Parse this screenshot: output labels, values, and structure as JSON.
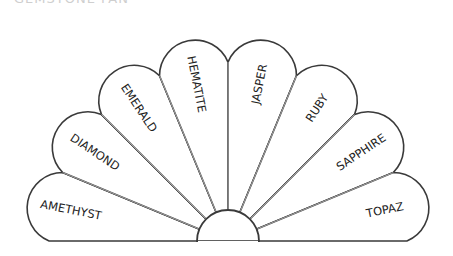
{
  "title": "GEMSTONE FAN",
  "diagram": {
    "type": "fan",
    "center": [
      228,
      241
    ],
    "colors": {
      "outline": "#3a3a3a",
      "spoke": "#bdbdbd",
      "text": "#222222",
      "background": "#ffffff"
    },
    "petals": [
      {
        "label": "AMETHYST"
      },
      {
        "label": "DIAMOND"
      },
      {
        "label": "EMERALD"
      },
      {
        "label": "HEMATITE"
      },
      {
        "label": "JASPER"
      },
      {
        "label": "RUBY"
      },
      {
        "label": "SAPPHIRE"
      },
      {
        "label": "TOPAZ"
      }
    ]
  }
}
